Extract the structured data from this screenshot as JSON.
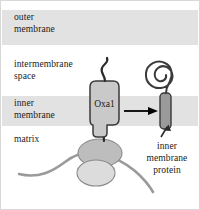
{
  "figure": {
    "width": 200,
    "height": 210,
    "background": "#ffffff",
    "border_color": "#d8d8d8"
  },
  "compartments": [
    {
      "id": "outer-membrane",
      "label": "outer\nmembrane",
      "band": true,
      "band_color": "#e2e2e2",
      "band_top": 9,
      "band_height": 35
    },
    {
      "id": "intermembrane-space",
      "label": "intermembrane\nspace",
      "band": false,
      "band_color": "#ffffff"
    },
    {
      "id": "inner-membrane",
      "label": "inner\nmembrane",
      "band": true,
      "band_color": "#e2e2e2",
      "band_top": 95,
      "band_height": 30
    },
    {
      "id": "matrix",
      "label": "matrix",
      "band": false,
      "band_color": "#ffffff"
    }
  ],
  "labels": {
    "outer_membrane": "outer\nmembrane",
    "intermembrane_space": "intermembrane\nspace",
    "inner_membrane": "inner\nmembrane",
    "matrix": "matrix",
    "inner_membrane_protein": "inner\nmembrane\nprotein"
  },
  "structures": {
    "translocase": {
      "name": "Oxa1",
      "label": "Oxa1",
      "fill": "#c9c9c9",
      "stroke": "#3a3a3a",
      "label_color": "#1a1a1a"
    },
    "nascent_chain": {
      "name": "nascent-polypeptide-chain",
      "stroke": "#2b2b2b"
    },
    "transfer_arrow": {
      "name": "transfer-arrow",
      "direction": "right",
      "color": "#000000"
    },
    "inserted_protein": {
      "name": "inner-membrane-protein",
      "transmembrane_fill": "#9a9a9a",
      "transmembrane_stroke": "#3a3a3a",
      "coil_stroke": "#3a3a3a",
      "coil_turns": 2.5
    },
    "pointer_arrow": {
      "name": "pointer-arrow",
      "direction": "up",
      "color": "#2b2b2b"
    },
    "ribosome": {
      "name": "ribosome",
      "large_subunit_fill": "#bdbdbd",
      "small_subunit_fill": "#dcdcdc",
      "stroke": "#8a8a8a"
    },
    "mrna": {
      "name": "mrna-strand",
      "stroke": "#9a9a9a"
    }
  },
  "colors": {
    "membrane_band": "#e2e2e2",
    "text": "#1a1a1a",
    "outline": "#3a3a3a",
    "mrna": "#9a9a9a"
  }
}
